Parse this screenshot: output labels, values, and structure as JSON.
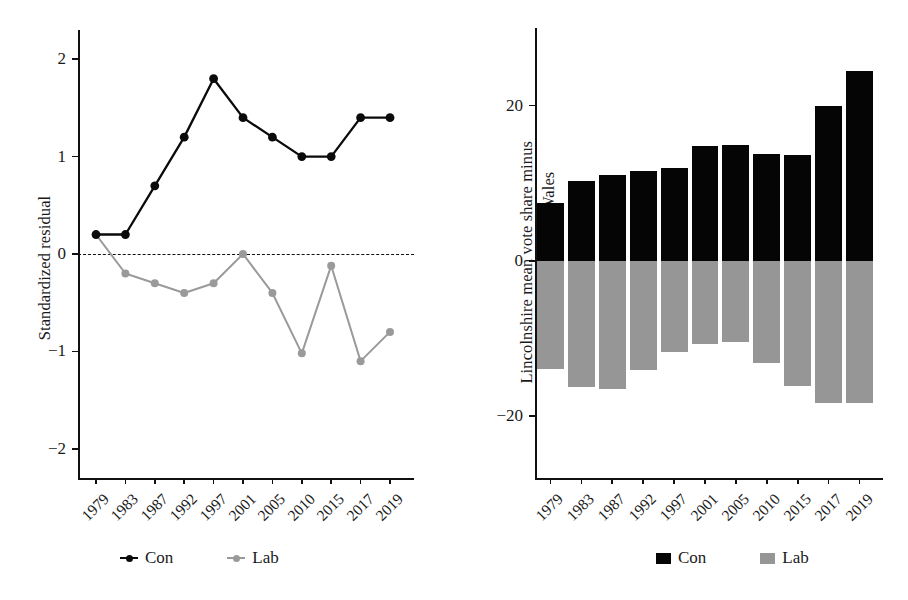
{
  "figure": {
    "panels": [
      "left",
      "right"
    ]
  },
  "left": {
    "ylabel": "Standardized residual",
    "y_ticks": [
      "2",
      "1",
      "0",
      "-1",
      "-2"
    ],
    "legend": [
      {
        "label": "Con",
        "color": "#0a0a0a",
        "marker": "line-point"
      },
      {
        "label": "Lab",
        "color": "#9a9a9a",
        "marker": "line-point"
      }
    ]
  },
  "right": {
    "ylabel_line1": "Lincolnshire mean vote share minus",
    "ylabel_line2": "mean for England & Wales",
    "y_ticks": [
      "20",
      "0",
      "-20"
    ],
    "legend": [
      {
        "label": "Con",
        "color": "#050505",
        "marker": "square"
      },
      {
        "label": "Lab",
        "color": "#969696",
        "marker": "square"
      }
    ]
  },
  "chart_data": [
    {
      "type": "line",
      "title": "",
      "xlabel": "",
      "ylabel": "Standardized residual",
      "categories": [
        "1979",
        "1983",
        "1987",
        "1992",
        "1997",
        "2001",
        "2005",
        "2010",
        "2015",
        "2017",
        "2019"
      ],
      "ylim": [
        -2.3,
        2.3
      ],
      "yticks": [
        -2,
        -1,
        0,
        1,
        2
      ],
      "grid": false,
      "reference_line": 0,
      "reference_line_style": "dashed",
      "legend_position": "bottom",
      "series": [
        {
          "name": "Con",
          "color": "#0a0a0a",
          "values": [
            0.2,
            0.2,
            0.7,
            1.2,
            1.8,
            1.4,
            1.2,
            1.0,
            1.0,
            1.4,
            1.4
          ]
        },
        {
          "name": "Lab",
          "color": "#9a9a9a",
          "values": [
            0.2,
            -0.2,
            -0.3,
            -0.4,
            -0.3,
            0.0,
            -0.4,
            -1.02,
            -0.12,
            -1.1,
            -0.8
          ]
        }
      ]
    },
    {
      "type": "bar",
      "title": "",
      "xlabel": "",
      "ylabel": "Lincolnshire mean vote share minus mean for England & Wales",
      "categories": [
        "1979",
        "1983",
        "1987",
        "1992",
        "1997",
        "2001",
        "2005",
        "2010",
        "2015",
        "2017",
        "2019"
      ],
      "ylim": [
        -28,
        30
      ],
      "yticks": [
        -20,
        0,
        20
      ],
      "grid": false,
      "legend_position": "bottom",
      "series": [
        {
          "name": "Con",
          "color": "#050505",
          "values": [
            7.5,
            10.3,
            11.0,
            11.6,
            12.0,
            14.8,
            14.9,
            13.8,
            13.6,
            20.0,
            24.5
          ]
        },
        {
          "name": "Lab",
          "color": "#969696",
          "values": [
            -14.0,
            -16.3,
            -16.5,
            -14.1,
            -11.7,
            -10.7,
            -10.5,
            -13.2,
            -16.2,
            -18.3,
            -18.3
          ]
        }
      ]
    }
  ]
}
